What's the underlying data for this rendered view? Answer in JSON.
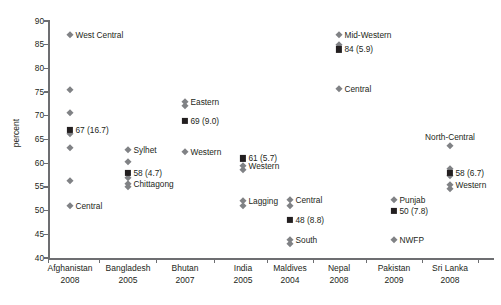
{
  "chart_data": {
    "type": "scatter",
    "title": "",
    "xlabel": "",
    "ylabel": "percent",
    "ylim": [
      40,
      90
    ],
    "ytick_step": 5,
    "yticks": [
      40,
      45,
      50,
      55,
      60,
      65,
      70,
      75,
      80,
      85,
      90
    ],
    "grid": false,
    "legend": "none",
    "marker_colors": {
      "region_diamond": "#808285",
      "national_square": "#231f20"
    },
    "axis_color": "#6d6e71",
    "categories": [
      {
        "country": "Afghanistan",
        "year": "2008"
      },
      {
        "country": "Bangladesh",
        "year": "2005"
      },
      {
        "country": "Bhutan",
        "year": "2007"
      },
      {
        "country": "India",
        "year": "2005"
      },
      {
        "country": "Maldives",
        "year": "2004"
      },
      {
        "country": "Nepal",
        "year": "2008"
      },
      {
        "country": "Pakistan",
        "year": "2009"
      },
      {
        "country": "Sri Lanka",
        "year": "2008"
      }
    ],
    "series": [
      {
        "country": "Afghanistan",
        "year": "2008",
        "national": {
          "value": 67,
          "cv": 16.7,
          "label": "67 (16.7)"
        },
        "regions": [
          {
            "label": "West Central",
            "value": 87.0
          },
          {
            "label": "",
            "value": 75.4
          },
          {
            "label": "",
            "value": 70.6
          },
          {
            "label": "",
            "value": 66.2
          },
          {
            "label": "",
            "value": 63.2
          },
          {
            "label": "",
            "value": 56.2
          },
          {
            "label": "Central",
            "value": 51.0
          }
        ]
      },
      {
        "country": "Bangladesh",
        "year": "2005",
        "national": {
          "value": 58,
          "cv": 4.7,
          "label": "58 (4.7)"
        },
        "regions": [
          {
            "label": "Sylhet",
            "value": 62.8
          },
          {
            "label": "",
            "value": 60.3
          },
          {
            "label": "",
            "value": 56.8
          },
          {
            "label": "Chittagong",
            "value": 55.6
          },
          {
            "label": "",
            "value": 55.0
          }
        ]
      },
      {
        "country": "Bhutan",
        "year": "2007",
        "national": {
          "value": 69,
          "cv": 9.0,
          "label": "69 (9.0)"
        },
        "regions": [
          {
            "label": "Eastern",
            "value": 73.0
          },
          {
            "label": "",
            "value": 72.0
          },
          {
            "label": "Western",
            "value": 62.4
          }
        ]
      },
      {
        "country": "India",
        "year": "2005",
        "national": {
          "value": 61,
          "cv": 5.7,
          "label": "61 (5.7)"
        },
        "regions": [
          {
            "label": "Western",
            "value": 59.5
          },
          {
            "label": "",
            "value": 58.5
          },
          {
            "label": "Lagging",
            "value": 52.0
          },
          {
            "label": "",
            "value": 51.0
          }
        ]
      },
      {
        "country": "Maldives",
        "year": "2004",
        "national": {
          "value": 48,
          "cv": 8.8,
          "label": "48 (8.8)"
        },
        "regions": [
          {
            "label": "Central",
            "value": 52.2
          },
          {
            "label": "",
            "value": 51.0
          },
          {
            "label": "South",
            "value": 43.8
          },
          {
            "label": "",
            "value": 43.0
          }
        ]
      },
      {
        "country": "Nepal",
        "year": "2008",
        "national": {
          "value": 84,
          "cv": 5.9,
          "label": "84 (5.9)"
        },
        "regions": [
          {
            "label": "Mid-Western",
            "value": 87.0
          },
          {
            "label": "",
            "value": 85.0
          },
          {
            "label": "Central",
            "value": 75.7
          }
        ]
      },
      {
        "country": "Pakistan",
        "year": "2009",
        "national": {
          "value": 50,
          "cv": 7.8,
          "label": "50 (7.8)"
        },
        "regions": [
          {
            "label": "Punjab",
            "value": 52.3
          },
          {
            "label": "NWFP",
            "value": 43.7
          }
        ]
      },
      {
        "country": "Sri Lanka",
        "year": "2008",
        "national": {
          "value": 58,
          "cv": 6.7,
          "label": "58 (6.7)"
        },
        "regions": [
          {
            "label": "North-Central",
            "value": 63.7
          },
          {
            "label": "",
            "value": 58.8
          },
          {
            "label": "",
            "value": 57.3
          },
          {
            "label": "Western",
            "value": 55.5
          },
          {
            "label": "",
            "value": 54.6
          }
        ]
      }
    ]
  },
  "axis": {
    "y_title": "percent",
    "y_labels": [
      "90",
      "85",
      "80",
      "75",
      "70",
      "65",
      "60",
      "55",
      "50",
      "45",
      "40"
    ],
    "x_labels": [
      {
        "name": "Afghanistan",
        "year": "2008"
      },
      {
        "name": "Bangladesh",
        "year": "2005"
      },
      {
        "name": "Bhutan",
        "year": "2007"
      },
      {
        "name": "India",
        "year": "2005"
      },
      {
        "name": "Maldives",
        "year": "2004"
      },
      {
        "name": "Nepal",
        "year": "2008"
      },
      {
        "name": "Pakistan",
        "year": "2009"
      },
      {
        "name": "Sri Lanka",
        "year": "2008"
      }
    ]
  },
  "point_labels": [
    "West Central",
    "Central",
    "67 (16.7)",
    "Sylhet",
    "Chittagong",
    "58 (4.7)",
    "Eastern",
    "Western",
    "69 (9.0)",
    "Western",
    "Lagging",
    "61 (5.7)",
    "Central",
    "South",
    "48 (8.8)",
    "Mid-Western",
    "Central",
    "84 (5.9)",
    "Punjab",
    "NWFP",
    "50 (7.8)",
    "North-Central",
    "Western",
    "58 (6.7)"
  ]
}
